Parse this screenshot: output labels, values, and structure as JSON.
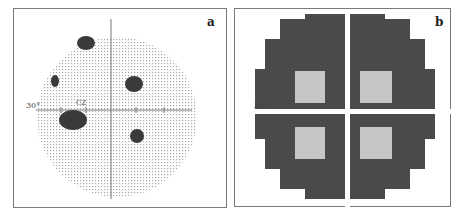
{
  "figure": {
    "panels": [
      {
        "id": "a",
        "label": "a",
        "axis_label": "30°",
        "style": "grey-dot field with dark defect clusters"
      },
      {
        "id": "b",
        "label": "b",
        "axis_label": "30°",
        "style": "dark stepped field with four bright quadrant clusters"
      }
    ]
  },
  "colors": {
    "frame": "#7a7a7a",
    "dot": "#b8b8b8",
    "cluster": "#3a3a3a",
    "dark_field": "#4a4a4a",
    "bright": "#e0e0e0"
  }
}
